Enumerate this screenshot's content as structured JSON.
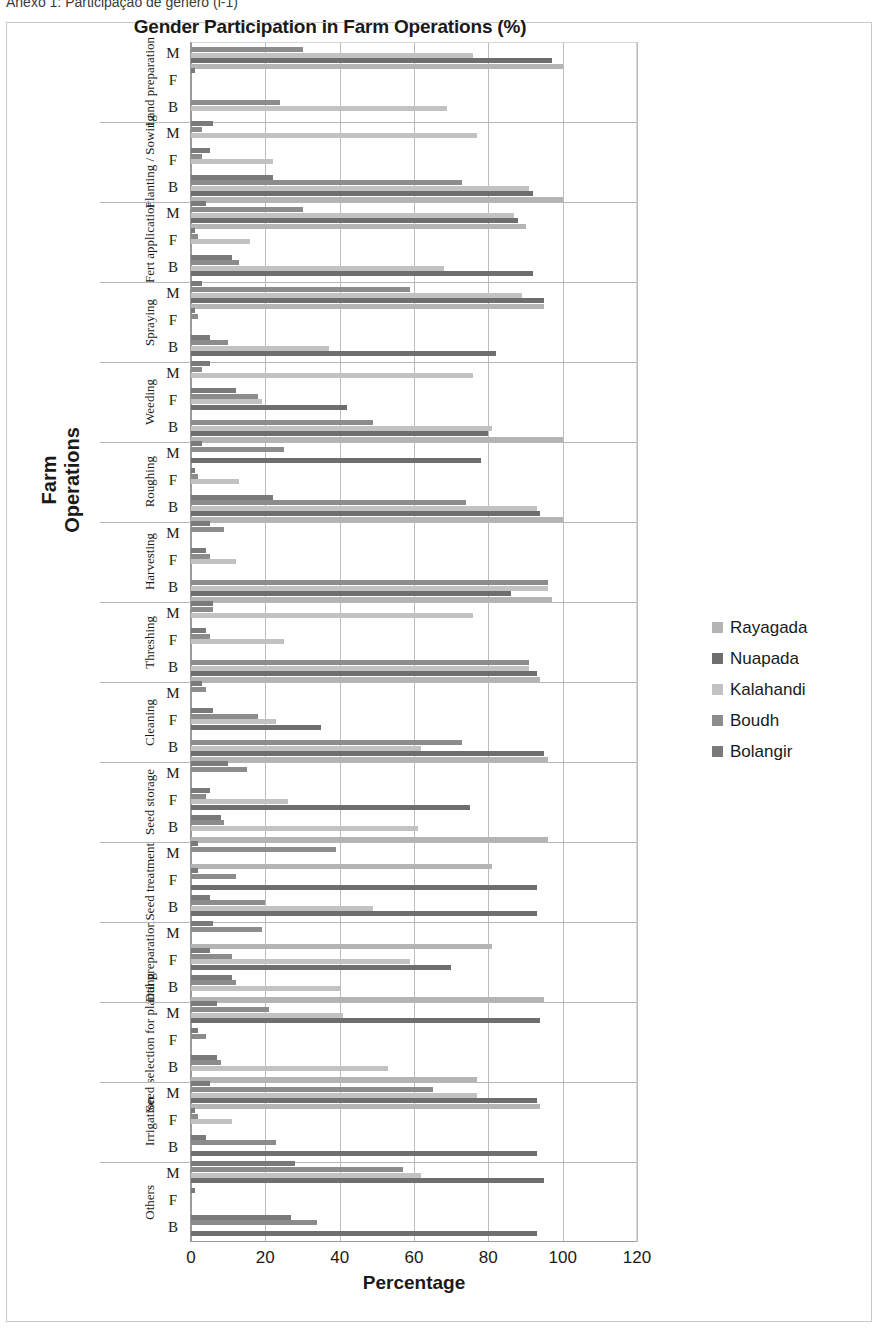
{
  "caption": "Anexo 1: Participação de gênero (i-1)",
  "chart_data": {
    "type": "bar",
    "orientation": "horizontal",
    "title": "Gender Participation in Farm Operations (%)",
    "xlabel": "Percentage",
    "ylabel": "Farm Operations",
    "xlim": [
      0,
      120
    ],
    "xticks": [
      0,
      20,
      40,
      60,
      80,
      100,
      120
    ],
    "grid": true,
    "legend_position": "right",
    "gender_labels": [
      "M",
      "F",
      "B"
    ],
    "series": [
      {
        "name": "Rayagada",
        "color": "#b4b4b4"
      },
      {
        "name": "Nuapada",
        "color": "#6e6e6e"
      },
      {
        "name": "Kalahandi",
        "color": "#c2c2c2"
      },
      {
        "name": "Boudh",
        "color": "#8c8c8c"
      },
      {
        "name": "Bolangir",
        "color": "#7a7a7a"
      }
    ],
    "categories": [
      "Land preparation",
      "Planting / Sowing",
      "Fert application",
      "Spraying",
      "Weeding",
      "Roughing",
      "Harvesting",
      "Threshing",
      "Cleaning",
      "Seed storage",
      "Seed treatment",
      "Dal preparation",
      "Seed selection for planting",
      "Irrigation",
      "Others"
    ],
    "groups": [
      {
        "category": "Land preparation",
        "rows": [
          {
            "gender": "M",
            "values": {
              "Rayagada": 100,
              "Nuapada": 97,
              "Kalahandi": 76,
              "Boudh": 30,
              "Bolangir": 0
            }
          },
          {
            "gender": "F",
            "values": {
              "Rayagada": 0,
              "Nuapada": 0,
              "Kalahandi": 0,
              "Boudh": 0,
              "Bolangir": 1
            }
          },
          {
            "gender": "B",
            "values": {
              "Rayagada": 0,
              "Nuapada": 0,
              "Kalahandi": 69,
              "Boudh": 24,
              "Bolangir": 0
            }
          }
        ]
      },
      {
        "category": "Planting / Sowing",
        "rows": [
          {
            "gender": "M",
            "values": {
              "Rayagada": 0,
              "Nuapada": 0,
              "Kalahandi": 77,
              "Boudh": 3,
              "Bolangir": 6
            }
          },
          {
            "gender": "F",
            "values": {
              "Rayagada": 0,
              "Nuapada": 0,
              "Kalahandi": 22,
              "Boudh": 3,
              "Bolangir": 5
            }
          },
          {
            "gender": "B",
            "values": {
              "Rayagada": 100,
              "Nuapada": 92,
              "Kalahandi": 91,
              "Boudh": 73,
              "Bolangir": 22
            }
          }
        ]
      },
      {
        "category": "Fert application",
        "rows": [
          {
            "gender": "M",
            "values": {
              "Rayagada": 90,
              "Nuapada": 88,
              "Kalahandi": 87,
              "Boudh": 30,
              "Bolangir": 4
            }
          },
          {
            "gender": "F",
            "values": {
              "Rayagada": 0,
              "Nuapada": 0,
              "Kalahandi": 16,
              "Boudh": 2,
              "Bolangir": 1
            }
          },
          {
            "gender": "B",
            "values": {
              "Rayagada": 0,
              "Nuapada": 92,
              "Kalahandi": 68,
              "Boudh": 13,
              "Bolangir": 11
            }
          }
        ]
      },
      {
        "category": "Spraying",
        "rows": [
          {
            "gender": "M",
            "values": {
              "Rayagada": 95,
              "Nuapada": 95,
              "Kalahandi": 89,
              "Boudh": 59,
              "Bolangir": 3
            }
          },
          {
            "gender": "F",
            "values": {
              "Rayagada": 0,
              "Nuapada": 0,
              "Kalahandi": 0,
              "Boudh": 2,
              "Bolangir": 1
            }
          },
          {
            "gender": "B",
            "values": {
              "Rayagada": 0,
              "Nuapada": 82,
              "Kalahandi": 37,
              "Boudh": 10,
              "Bolangir": 5
            }
          }
        ]
      },
      {
        "category": "Weeding",
        "rows": [
          {
            "gender": "M",
            "values": {
              "Rayagada": 0,
              "Nuapada": 0,
              "Kalahandi": 76,
              "Boudh": 3,
              "Bolangir": 5
            }
          },
          {
            "gender": "F",
            "values": {
              "Rayagada": 0,
              "Nuapada": 42,
              "Kalahandi": 19,
              "Boudh": 18,
              "Bolangir": 12
            }
          },
          {
            "gender": "B",
            "values": {
              "Rayagada": 100,
              "Nuapada": 80,
              "Kalahandi": 81,
              "Boudh": 49,
              "Bolangir": 0
            }
          }
        ]
      },
      {
        "category": "Roughing",
        "rows": [
          {
            "gender": "M",
            "values": {
              "Rayagada": 0,
              "Nuapada": 78,
              "Kalahandi": 0,
              "Boudh": 25,
              "Bolangir": 3
            }
          },
          {
            "gender": "F",
            "values": {
              "Rayagada": 0,
              "Nuapada": 0,
              "Kalahandi": 13,
              "Boudh": 2,
              "Bolangir": 1
            }
          },
          {
            "gender": "B",
            "values": {
              "Rayagada": 100,
              "Nuapada": 94,
              "Kalahandi": 93,
              "Boudh": 74,
              "Bolangir": 22
            }
          }
        ]
      },
      {
        "category": "Harvesting",
        "rows": [
          {
            "gender": "M",
            "values": {
              "Rayagada": 0,
              "Nuapada": 0,
              "Kalahandi": 0,
              "Boudh": 9,
              "Bolangir": 5
            }
          },
          {
            "gender": "F",
            "values": {
              "Rayagada": 0,
              "Nuapada": 0,
              "Kalahandi": 12,
              "Boudh": 5,
              "Bolangir": 4
            }
          },
          {
            "gender": "B",
            "values": {
              "Rayagada": 97,
              "Nuapada": 86,
              "Kalahandi": 96,
              "Boudh": 96,
              "Bolangir": 0
            }
          }
        ]
      },
      {
        "category": "Threshing",
        "rows": [
          {
            "gender": "M",
            "values": {
              "Rayagada": 0,
              "Nuapada": 0,
              "Kalahandi": 76,
              "Boudh": 6,
              "Bolangir": 6
            }
          },
          {
            "gender": "F",
            "values": {
              "Rayagada": 0,
              "Nuapada": 0,
              "Kalahandi": 25,
              "Boudh": 5,
              "Bolangir": 4
            }
          },
          {
            "gender": "B",
            "values": {
              "Rayagada": 94,
              "Nuapada": 93,
              "Kalahandi": 91,
              "Boudh": 91,
              "Bolangir": 0
            }
          }
        ]
      },
      {
        "category": "Cleaning",
        "rows": [
          {
            "gender": "M",
            "values": {
              "Rayagada": 0,
              "Nuapada": 0,
              "Kalahandi": 0,
              "Boudh": 4,
              "Bolangir": 3
            }
          },
          {
            "gender": "F",
            "values": {
              "Rayagada": 0,
              "Nuapada": 35,
              "Kalahandi": 23,
              "Boudh": 18,
              "Bolangir": 6
            }
          },
          {
            "gender": "B",
            "values": {
              "Rayagada": 96,
              "Nuapada": 95,
              "Kalahandi": 62,
              "Boudh": 73,
              "Bolangir": 0
            }
          }
        ]
      },
      {
        "category": "Seed storage",
        "rows": [
          {
            "gender": "M",
            "values": {
              "Rayagada": 0,
              "Nuapada": 0,
              "Kalahandi": 0,
              "Boudh": 15,
              "Bolangir": 10
            }
          },
          {
            "gender": "F",
            "values": {
              "Rayagada": 0,
              "Nuapada": 75,
              "Kalahandi": 26,
              "Boudh": 4,
              "Bolangir": 5
            }
          },
          {
            "gender": "B",
            "values": {
              "Rayagada": 96,
              "Nuapada": 0,
              "Kalahandi": 61,
              "Boudh": 9,
              "Bolangir": 8
            }
          }
        ]
      },
      {
        "category": "Seed treatment",
        "rows": [
          {
            "gender": "M",
            "values": {
              "Rayagada": 81,
              "Nuapada": 0,
              "Kalahandi": 0,
              "Boudh": 39,
              "Bolangir": 2
            }
          },
          {
            "gender": "F",
            "values": {
              "Rayagada": 0,
              "Nuapada": 93,
              "Kalahandi": 0,
              "Boudh": 12,
              "Bolangir": 2
            }
          },
          {
            "gender": "B",
            "values": {
              "Rayagada": 0,
              "Nuapada": 93,
              "Kalahandi": 49,
              "Boudh": 20,
              "Bolangir": 5
            }
          }
        ]
      },
      {
        "category": "Dal preparation",
        "rows": [
          {
            "gender": "M",
            "values": {
              "Rayagada": 81,
              "Nuapada": 0,
              "Kalahandi": 0,
              "Boudh": 19,
              "Bolangir": 6
            }
          },
          {
            "gender": "F",
            "values": {
              "Rayagada": 0,
              "Nuapada": 70,
              "Kalahandi": 59,
              "Boudh": 11,
              "Bolangir": 5
            }
          },
          {
            "gender": "B",
            "values": {
              "Rayagada": 95,
              "Nuapada": 0,
              "Kalahandi": 40,
              "Boudh": 12,
              "Bolangir": 11
            }
          }
        ]
      },
      {
        "category": "Seed selection for planting",
        "rows": [
          {
            "gender": "M",
            "values": {
              "Rayagada": 0,
              "Nuapada": 94,
              "Kalahandi": 41,
              "Boudh": 21,
              "Bolangir": 7
            }
          },
          {
            "gender": "F",
            "values": {
              "Rayagada": 0,
              "Nuapada": 0,
              "Kalahandi": 0,
              "Boudh": 4,
              "Bolangir": 2
            }
          },
          {
            "gender": "B",
            "values": {
              "Rayagada": 77,
              "Nuapada": 0,
              "Kalahandi": 53,
              "Boudh": 8,
              "Bolangir": 7
            }
          }
        ]
      },
      {
        "category": "Irrigation",
        "rows": [
          {
            "gender": "M",
            "values": {
              "Rayagada": 94,
              "Nuapada": 93,
              "Kalahandi": 77,
              "Boudh": 65,
              "Bolangir": 5
            }
          },
          {
            "gender": "F",
            "values": {
              "Rayagada": 0,
              "Nuapada": 0,
              "Kalahandi": 11,
              "Boudh": 2,
              "Bolangir": 1
            }
          },
          {
            "gender": "B",
            "values": {
              "Rayagada": 0,
              "Nuapada": 93,
              "Kalahandi": 0,
              "Boudh": 23,
              "Bolangir": 4
            }
          }
        ]
      },
      {
        "category": "Others",
        "rows": [
          {
            "gender": "M",
            "values": {
              "Rayagada": 0,
              "Nuapada": 95,
              "Kalahandi": 62,
              "Boudh": 57,
              "Bolangir": 28
            }
          },
          {
            "gender": "F",
            "values": {
              "Rayagada": 0,
              "Nuapada": 0,
              "Kalahandi": 0,
              "Boudh": 0,
              "Bolangir": 1
            }
          },
          {
            "gender": "B",
            "values": {
              "Rayagada": 0,
              "Nuapada": 93,
              "Kalahandi": 0,
              "Boudh": 34,
              "Bolangir": 27
            }
          }
        ]
      }
    ]
  }
}
